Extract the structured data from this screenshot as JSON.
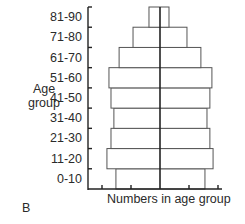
{
  "chart_data": {
    "type": "bar",
    "orientation": "horizontal-pyramid",
    "title": "",
    "panel_label": "B",
    "xlabel": "Numbers in age group",
    "ylabel": "Age group",
    "categories": [
      "0-10",
      "11-20",
      "21-30",
      "31-40",
      "41-50",
      "51-60",
      "61-70",
      "71-80",
      "81-90"
    ],
    "series": [
      {
        "name": "left half",
        "values": [
          1.52,
          1.83,
          1.69,
          1.59,
          1.69,
          1.76,
          1.41,
          0.93,
          0.38
        ]
      },
      {
        "name": "right half",
        "values": [
          1.55,
          1.83,
          1.72,
          1.62,
          1.72,
          1.79,
          1.41,
          0.93,
          0.31
        ]
      }
    ],
    "x_ticks_per_side": 2,
    "x_tick_labels": [],
    "grid": false,
    "legend": "none"
  },
  "labels": {
    "ylabel_line1": "Age",
    "ylabel_line2": "group",
    "xlabel": "Numbers in age group",
    "panel": "B",
    "categories": [
      "0-10",
      "11-20",
      "21-30",
      "31-40",
      "41-50",
      "51-60",
      "61-70",
      "71-80",
      "81-90"
    ]
  }
}
